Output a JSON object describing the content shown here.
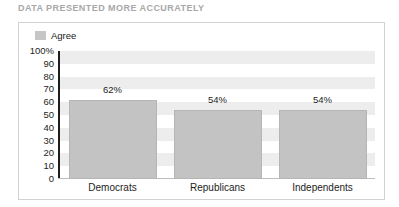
{
  "chart_data": {
    "type": "bar",
    "title": "DATA PRESENTED MORE ACCURATELY",
    "categories": [
      "Democrats",
      "Republicans",
      "Independents"
    ],
    "values": [
      62,
      54,
      54
    ],
    "value_labels": [
      "62%",
      "54%",
      "54%"
    ],
    "series": [
      {
        "name": "Agree",
        "values": [
          62,
          54,
          54
        ],
        "color": "#c3c3c3"
      }
    ],
    "legend": {
      "position": "top-left",
      "entries": [
        "Agree"
      ]
    },
    "xlabel": "",
    "ylabel": "",
    "ylim": [
      0,
      100
    ],
    "ytick_values": [
      100,
      90,
      80,
      70,
      60,
      50,
      40,
      30,
      20,
      10,
      0
    ],
    "ytick_labels": [
      "100%",
      "90",
      "80",
      "70",
      "60",
      "50",
      "40",
      "30",
      "20",
      "10",
      "0"
    ],
    "grid": "alternating-horizontal-bands",
    "band_color": "#ededed",
    "axis_color": "#1d1d1d",
    "frame_color": "#d2d2d2",
    "title_color": "#a8a8a8"
  }
}
